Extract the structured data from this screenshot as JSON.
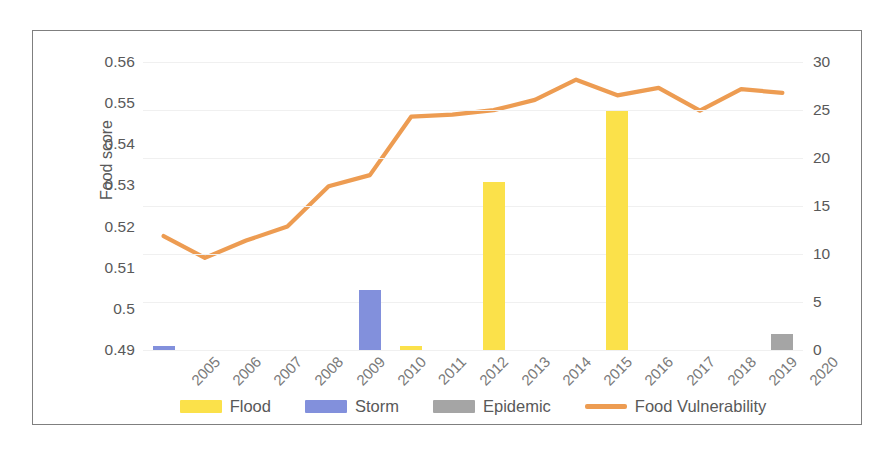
{
  "chart_data": {
    "type": "bar",
    "title": "",
    "categories": [
      "2005",
      "2006",
      "2007",
      "2008",
      "2009",
      "2010",
      "2011",
      "2012",
      "2013",
      "2014",
      "2015",
      "2016",
      "2017",
      "2018",
      "2019",
      "2020"
    ],
    "xlabel": "",
    "ylabel": "Food score",
    "ylabel_secondary": "# of people affected in thousands",
    "ylim": [
      0.49,
      0.56
    ],
    "ylim_secondary": [
      0,
      30
    ],
    "yticks": [
      "0.49",
      "0.5",
      "0.51",
      "0.52",
      "0.53",
      "0.54",
      "0.55",
      "0.56"
    ],
    "yticks_secondary": [
      "0",
      "5",
      "10",
      "15",
      "20",
      "25",
      "30"
    ],
    "grid": true,
    "legend_position": "bottom",
    "series": [
      {
        "name": "Flood",
        "type": "bar",
        "axis": "secondary",
        "color": "#fbe14a",
        "values": [
          0,
          0,
          0,
          0,
          0,
          0,
          0.4,
          0,
          17.5,
          0,
          0,
          24.9,
          0,
          0,
          0,
          0
        ]
      },
      {
        "name": "Storm",
        "type": "bar",
        "axis": "secondary",
        "color": "#8290dc",
        "values": [
          0.4,
          0,
          0,
          0,
          0,
          6.3,
          0,
          0,
          0,
          0,
          0,
          0,
          0,
          0,
          0,
          0
        ]
      },
      {
        "name": "Epidemic",
        "type": "bar",
        "axis": "secondary",
        "color": "#a5a5a5",
        "values": [
          0,
          0,
          0,
          0,
          0,
          0,
          0,
          0,
          0,
          0,
          0,
          0,
          0,
          0,
          0,
          1.7
        ]
      },
      {
        "name": "Food Vulnerability",
        "type": "line",
        "axis": "primary",
        "color": "#ed9c52",
        "values": [
          0.5177,
          0.5124,
          0.5166,
          0.52,
          0.5298,
          0.5325,
          0.5467,
          0.5472,
          0.5483,
          0.5508,
          0.5557,
          0.5519,
          0.5537,
          0.5482,
          0.5534,
          0.5525
        ]
      }
    ]
  },
  "legend": {
    "items": [
      {
        "label": "Flood",
        "color": "#fbe14a",
        "marker": "bar-swatch"
      },
      {
        "label": "Storm",
        "color": "#8290dc",
        "marker": "bar-swatch"
      },
      {
        "label": "Epidemic",
        "color": "#a5a5a5",
        "marker": "bar-swatch"
      },
      {
        "label": "Food Vulnerability",
        "color": "#ed9c52",
        "marker": "line-swatch"
      }
    ]
  },
  "colors": {
    "flood": "#fbe14a",
    "storm": "#8290dc",
    "epidemic": "#a5a5a5",
    "food_vulnerability": "#ed9c52",
    "axis_text": "#595959",
    "frame": "#7f7f7f",
    "gridline": "#f0f0f0"
  }
}
